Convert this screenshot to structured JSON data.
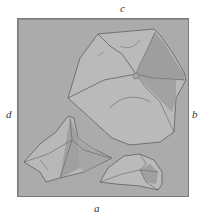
{
  "figure": {
    "labels": {
      "top": "c",
      "bottom": "a",
      "left": "d",
      "right": "b"
    },
    "colors": {
      "background": "#ababab",
      "fragment_fill": "#b9b9b9",
      "fragment_shade": "#9d9d9d",
      "outline": "#555555"
    },
    "fragments": [
      {
        "name": "large-fragment",
        "position": "upper-right"
      },
      {
        "name": "triangular-fragment",
        "position": "lower-left"
      },
      {
        "name": "small-fragment",
        "position": "lower-right"
      }
    ]
  }
}
